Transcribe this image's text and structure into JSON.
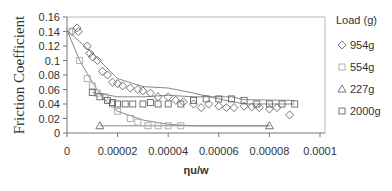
{
  "chart_data": {
    "type": "scatter",
    "title": "",
    "xlabel": "ηu/w",
    "ylabel": "Friction Coefficient",
    "xlim": [
      0,
      0.0001
    ],
    "ylim": [
      0,
      0.16
    ],
    "x_ticks": [
      "0",
      "0.00002",
      "0.00004",
      "0.00006",
      "0.00008",
      "0.0001"
    ],
    "y_ticks": [
      "0",
      "0.02",
      "0.04",
      "0.06",
      "0.08",
      "0.1",
      "0.12",
      "0.14",
      "0.16"
    ],
    "grid": false,
    "legend": {
      "title": "Load (g)",
      "position": "right"
    },
    "series": [
      {
        "name": "954g",
        "marker": "diamond",
        "points": [
          [
            2e-06,
            0.14
          ],
          [
            4e-06,
            0.145
          ],
          [
            4.5e-06,
            0.14
          ],
          [
            8e-06,
            0.12
          ],
          [
            9e-06,
            0.11
          ],
          [
            1e-05,
            0.105
          ],
          [
            1.2e-05,
            0.1
          ],
          [
            1.4e-05,
            0.085
          ],
          [
            1.6e-05,
            0.08
          ],
          [
            1.8e-05,
            0.07
          ],
          [
            2e-05,
            0.068
          ],
          [
            2.2e-05,
            0.065
          ],
          [
            2.5e-05,
            0.062
          ],
          [
            2.8e-05,
            0.06
          ],
          [
            3e-05,
            0.058
          ],
          [
            3.3e-05,
            0.055
          ],
          [
            3.6e-05,
            0.05
          ],
          [
            4e-05,
            0.05
          ],
          [
            4.3e-05,
            0.045
          ],
          [
            4.6e-05,
            0.043
          ],
          [
            5e-05,
            0.04
          ],
          [
            5.3e-05,
            0.035
          ],
          [
            5.6e-05,
            0.04
          ],
          [
            6e-05,
            0.037
          ],
          [
            6.3e-05,
            0.035
          ],
          [
            6.6e-05,
            0.035
          ],
          [
            7e-05,
            0.037
          ],
          [
            7.3e-05,
            0.036
          ],
          [
            7.6e-05,
            0.035
          ],
          [
            8e-05,
            0.033
          ],
          [
            8.3e-05,
            0.035
          ],
          [
            8.8e-05,
            0.025
          ]
        ]
      },
      {
        "name": "554g",
        "marker": "square-light",
        "points": [
          [
            1e-06,
            0.14
          ],
          [
            5e-06,
            0.1
          ],
          [
            8e-06,
            0.075
          ],
          [
            1e-05,
            0.065
          ],
          [
            1.2e-05,
            0.055
          ],
          [
            1.5e-05,
            0.05
          ],
          [
            1.8e-05,
            0.04
          ],
          [
            2e-05,
            0.03
          ],
          [
            2.5e-05,
            0.02
          ],
          [
            2.8e-05,
            0.015
          ],
          [
            3.2e-05,
            0.01
          ],
          [
            3.6e-05,
            0.01
          ],
          [
            4e-05,
            0.01
          ],
          [
            4.5e-05,
            0.01
          ]
        ]
      },
      {
        "name": "227g",
        "marker": "triangle",
        "points": [
          [
            1.3e-05,
            0.01
          ],
          [
            8e-05,
            0.01
          ]
        ]
      },
      {
        "name": "2000g",
        "marker": "square",
        "points": [
          [
            1e-05,
            0.056
          ],
          [
            1.3e-05,
            0.05
          ],
          [
            1.6e-05,
            0.045
          ],
          [
            1.8e-05,
            0.042
          ],
          [
            2e-05,
            0.04
          ],
          [
            2.3e-05,
            0.04
          ],
          [
            2.6e-05,
            0.04
          ],
          [
            3e-05,
            0.04
          ],
          [
            3.3e-05,
            0.042
          ],
          [
            3.6e-05,
            0.04
          ],
          [
            4e-05,
            0.04
          ],
          [
            4.5e-05,
            0.04
          ],
          [
            5e-05,
            0.045
          ],
          [
            5.5e-05,
            0.047
          ],
          [
            6e-05,
            0.047
          ],
          [
            6.5e-05,
            0.047
          ],
          [
            7e-05,
            0.045
          ],
          [
            7.5e-05,
            0.04
          ],
          [
            8e-05,
            0.04
          ],
          [
            8.5e-05,
            0.04
          ],
          [
            9e-05,
            0.04
          ]
        ]
      }
    ],
    "trend_lines": [
      {
        "name": "954g-fit",
        "points": [
          [
            0,
            0.142
          ],
          [
            1e-05,
            0.11
          ],
          [
            2e-05,
            0.075
          ],
          [
            3e-05,
            0.064
          ],
          [
            4e-05,
            0.062
          ],
          [
            5e-05,
            0.055
          ],
          [
            6e-05,
            0.047
          ],
          [
            7e-05,
            0.04
          ],
          [
            9e-05,
            0.04
          ]
        ]
      },
      {
        "name": "554g-fit",
        "points": [
          [
            0,
            0.142
          ],
          [
            5e-06,
            0.1
          ],
          [
            1e-05,
            0.07
          ],
          [
            1.5e-05,
            0.045
          ],
          [
            2e-05,
            0.03
          ],
          [
            3e-05,
            0.018
          ],
          [
            4e-05,
            0.012
          ],
          [
            5e-05,
            0.01
          ],
          [
            8e-05,
            0.01
          ]
        ]
      },
      {
        "name": "227g-fit",
        "points": [
          [
            1.3e-05,
            0.01
          ],
          [
            8e-05,
            0.01
          ]
        ]
      },
      {
        "name": "2000g-fit",
        "points": [
          [
            1e-05,
            0.056
          ],
          [
            2e-05,
            0.05
          ],
          [
            3e-05,
            0.05
          ],
          [
            4e-05,
            0.052
          ],
          [
            5e-05,
            0.05
          ],
          [
            6.5e-05,
            0.05
          ],
          [
            7e-05,
            0.046
          ],
          [
            9e-05,
            0.045
          ]
        ]
      }
    ]
  },
  "labels": {
    "ylabel": "Friction Coefficient",
    "xlabel": "ηu/w",
    "legend_title": "Load (g)",
    "legend_items": [
      "954g",
      "554g",
      "227g",
      "2000g"
    ],
    "x_ticks": [
      "0",
      "0.00002",
      "0.00004",
      "0.00006",
      "0.00008",
      "0.0001"
    ],
    "y_ticks": [
      "0",
      "0.02",
      "0.04",
      "0.06",
      "0.08",
      "0.1",
      "0.12",
      "0.14",
      "0.16"
    ]
  },
  "colors": {
    "axis": "#777777",
    "marker": "#666666",
    "marker_light": "#aaaaaa",
    "line": "#888888"
  }
}
